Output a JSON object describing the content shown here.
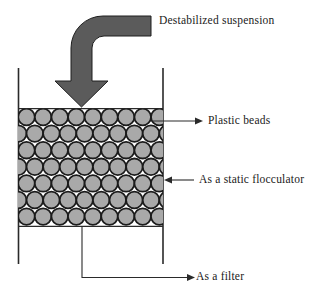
{
  "diagram": {
    "labels": {
      "suspension": "Destabilized suspension",
      "beads": "Plastic beads",
      "flocculator": "As a static flocculator",
      "filter": "As a filter"
    },
    "colors": {
      "background": "#ffffff",
      "text": "#1a1a1a",
      "line": "#2a2a2a",
      "arrow_fill": "#5b5b5b",
      "arrow_stroke": "#1f1f1f",
      "bead_fill": "#a9a9a9",
      "bead_stroke": "#1c1c1c"
    },
    "beads_grid": {
      "rows": 7,
      "beads_per_even_row": 9,
      "beads_per_odd_row": 10,
      "bead_diameter": 16.6,
      "row_spacing": 16.6,
      "first_row_center_y": 117,
      "even_row_start_x": 26.5,
      "odd_row_start_x": 18.2,
      "bed": {
        "x": 18,
        "y": 108.6,
        "width": 145,
        "height": 117.8
      }
    }
  }
}
